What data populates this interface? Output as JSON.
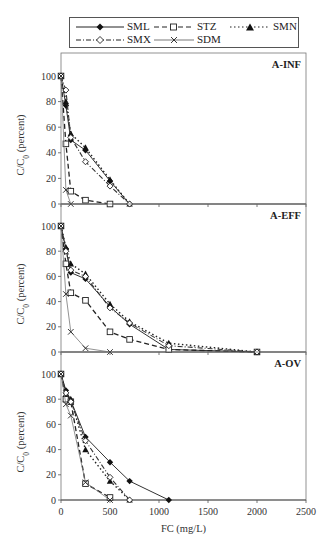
{
  "chart_data": [
    {
      "type": "line",
      "panel_label": "A-INF",
      "xlabel": "",
      "ylabel": "C/C0 (percent)",
      "xlim": [
        0,
        2500
      ],
      "ylim": [
        0,
        110
      ],
      "yticks": [
        0,
        20,
        40,
        60,
        80,
        100
      ],
      "grid": false,
      "series": [
        {
          "name": "SML",
          "x": [
            0,
            50,
            100,
            250,
            500,
            700
          ],
          "values": [
            100,
            77,
            50,
            42,
            18,
            0
          ]
        },
        {
          "name": "STZ",
          "x": [
            0,
            50,
            100,
            250,
            500
          ],
          "values": [
            100,
            47,
            10,
            3,
            0
          ]
        },
        {
          "name": "SMN",
          "x": [
            0,
            50,
            100,
            250,
            500,
            700
          ],
          "values": [
            100,
            80,
            55,
            44,
            19,
            0
          ]
        },
        {
          "name": "SMX",
          "x": [
            0,
            50,
            100,
            250,
            500,
            700
          ],
          "values": [
            100,
            89,
            52,
            33,
            14,
            0
          ]
        },
        {
          "name": "SDM",
          "x": [
            0,
            50,
            100
          ],
          "values": [
            100,
            11,
            0
          ]
        }
      ]
    },
    {
      "type": "line",
      "panel_label": "A-EFF",
      "xlabel": "",
      "ylabel": "C/C0 (percent)",
      "xlim": [
        0,
        2500
      ],
      "ylim": [
        0,
        110
      ],
      "yticks": [
        0,
        20,
        40,
        60,
        80,
        100
      ],
      "grid": false,
      "series": [
        {
          "name": "SML",
          "x": [
            0,
            50,
            100,
            250,
            500,
            700,
            1100,
            2000
          ],
          "values": [
            100,
            82,
            63,
            58,
            36,
            22,
            2,
            0
          ]
        },
        {
          "name": "STZ",
          "x": [
            0,
            50,
            100,
            250,
            500,
            700,
            1100,
            2000
          ],
          "values": [
            100,
            70,
            47,
            41,
            16,
            10,
            2,
            0
          ]
        },
        {
          "name": "SMN",
          "x": [
            0,
            50,
            100,
            250,
            500,
            700,
            1100,
            2000
          ],
          "values": [
            100,
            83,
            70,
            62,
            38,
            24,
            7,
            0
          ]
        },
        {
          "name": "SMX",
          "x": [
            0,
            50,
            100,
            250,
            500,
            700,
            1100,
            2000
          ],
          "values": [
            100,
            80,
            65,
            60,
            35,
            23,
            5,
            0
          ]
        },
        {
          "name": "SDM",
          "x": [
            0,
            50,
            100,
            250,
            500
          ],
          "values": [
            100,
            46,
            16,
            3,
            0
          ]
        }
      ]
    },
    {
      "type": "line",
      "panel_label": "A-OV",
      "xlabel": "FC (mg/L)",
      "ylabel": "C/C0 (percent)",
      "xlim": [
        0,
        2500
      ],
      "ylim": [
        0,
        110
      ],
      "xticks": [
        0,
        500,
        1000,
        1500,
        2000,
        2500
      ],
      "yticks": [
        0,
        20,
        40,
        60,
        80,
        100
      ],
      "grid": false,
      "series": [
        {
          "name": "SML",
          "x": [
            0,
            50,
            100,
            250,
            500,
            700,
            1100
          ],
          "values": [
            100,
            87,
            79,
            50,
            30,
            15,
            0
          ]
        },
        {
          "name": "STZ",
          "x": [
            0,
            50,
            100,
            250,
            500
          ],
          "values": [
            100,
            80,
            78,
            13,
            2
          ]
        },
        {
          "name": "SMN",
          "x": [
            0,
            50,
            100,
            250,
            500,
            700
          ],
          "values": [
            100,
            84,
            80,
            40,
            15,
            0
          ]
        },
        {
          "name": "SMX",
          "x": [
            0,
            50,
            100,
            250,
            500,
            700
          ],
          "values": [
            100,
            85,
            78,
            47,
            18,
            0
          ]
        },
        {
          "name": "SDM",
          "x": [
            0,
            50,
            100,
            250,
            500
          ],
          "values": [
            100,
            76,
            67,
            14,
            0
          ]
        }
      ]
    }
  ],
  "legend": {
    "items": [
      {
        "label": "SML",
        "style": "solid",
        "marker": "filled-diamond"
      },
      {
        "label": "STZ",
        "style": "dashed",
        "marker": "open-square"
      },
      {
        "label": "SMN",
        "style": "dotted",
        "marker": "filled-triangle"
      },
      {
        "label": "SMX",
        "style": "dash-dot",
        "marker": "open-diamond"
      },
      {
        "label": "SDM",
        "style": "thin-solid",
        "marker": "x"
      }
    ]
  },
  "axes": {
    "ylabel": "C/C0 (percent)",
    "xlabel": "FC (mg/L)",
    "xtick_labels": [
      "0",
      "500",
      "1000",
      "1500",
      "2000",
      "2500"
    ],
    "ytick_labels": [
      "0",
      "20",
      "40",
      "60",
      "80",
      "100"
    ]
  },
  "colors": {
    "line": "#222222",
    "axis": "#444444",
    "light_line": "#777777"
  }
}
